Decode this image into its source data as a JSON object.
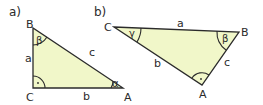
{
  "colors": {
    "fill": "#f1f7c9",
    "stroke": "#2b2b2b",
    "background": "#ffffff"
  },
  "diagram_a": {
    "part_label": "a)",
    "vertices": {
      "A": {
        "label": "A",
        "x": 123,
        "y": 88
      },
      "B": {
        "label": "B",
        "x": 33,
        "y": 28
      },
      "C": {
        "label": "C",
        "x": 33,
        "y": 88
      }
    },
    "sides": {
      "a": "a",
      "b": "b",
      "c": "c"
    },
    "angles": {
      "alpha": "α",
      "beta": "β"
    },
    "right_angle_at": "C",
    "right_angle_mark": "·"
  },
  "diagram_b": {
    "part_label": "b)",
    "vertices": {
      "A": {
        "label": "A",
        "x": 202,
        "y": 85
      },
      "B": {
        "label": "B",
        "x": 239,
        "y": 32
      },
      "C": {
        "label": "C",
        "x": 114,
        "y": 27
      }
    },
    "sides": {
      "a": "a",
      "b": "b",
      "c": "c"
    },
    "angles": {
      "gamma": "γ",
      "beta": "β"
    },
    "right_angle_at": "A",
    "right_angle_mark": "·"
  }
}
